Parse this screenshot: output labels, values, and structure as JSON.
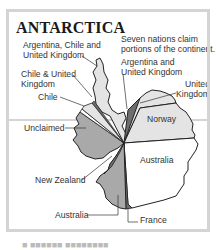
{
  "title": "ANTARCTICA",
  "note": [
    "Seven nations claim",
    "portions of the continent."
  ],
  "labels": {
    "arg_chile_uk": [
      "Argentina, Chile and",
      "United Kingdom"
    ],
    "chile_uk": [
      "Chile & United",
      "Kingdom"
    ],
    "chile": "Chile",
    "unclaimed": "Unclaimed",
    "new_zealand": "New Zealand",
    "australia_bottom": "Australia",
    "france": "France",
    "arg_uk": [
      "Argentina and",
      "United Kingdom"
    ],
    "uk": [
      "United",
      "Kingdom"
    ],
    "norway": "Norway",
    "australia_main": "Australia"
  },
  "colors": {
    "frame": "#d4d4d4",
    "light": "#e4e4e4",
    "white": "#ffffff",
    "mid": "#a9a9a9",
    "dark": "#6e6e6e",
    "outline": "#222222"
  },
  "bottom_caption": "■ ■■■■■■ ■■■■■■■■"
}
